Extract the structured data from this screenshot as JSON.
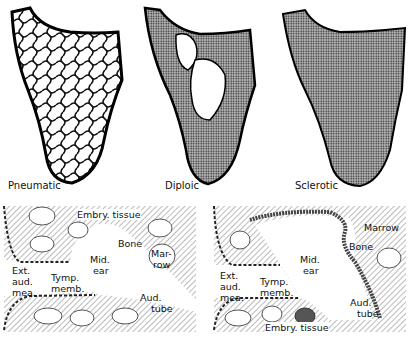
{
  "top_row": {
    "panels": [
      {
        "label": "Pneumatic"
      },
      {
        "label": "Diploic"
      },
      {
        "label": "Sclerotic"
      }
    ]
  },
  "bottom_row": {
    "left": {
      "labels": {
        "embry_tissue": "Embry. tissue",
        "bone": "Bone",
        "marrow_1": "Mar-",
        "marrow_2": "row",
        "mid_ear_1": "Mid.",
        "mid_ear_2": "ear",
        "ext_1": "Ext.",
        "ext_2": "aud.",
        "ext_3": "mea.",
        "tymp_1": "Tymp.",
        "tymp_2": "memb.",
        "aud_1": "Aud.",
        "aud_2": "tube"
      }
    },
    "right": {
      "labels": {
        "marrow": "Marrow",
        "bone": "Bone",
        "mid_ear_1": "Mid.",
        "mid_ear_2": "ear",
        "ext_1": "Ext.",
        "ext_2": "aud.",
        "ext_3": "mea.",
        "tymp_1": "Tymp.",
        "tymp_2": "memb.",
        "aud_1": "Aud.",
        "aud_2": "tube",
        "embry_tissue": "Embry. tissue"
      }
    }
  }
}
